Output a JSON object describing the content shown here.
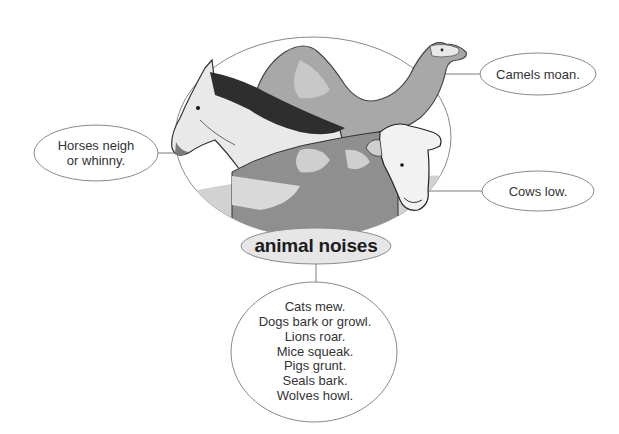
{
  "diagram": {
    "type": "mind-map",
    "center": {
      "label": "animal noises",
      "fill": "#e6e6e6"
    },
    "illustration": {
      "subjects": [
        "horse",
        "camel",
        "cow"
      ],
      "style": "grayscale drawing inside ellipse"
    },
    "satellites": [
      {
        "id": "horses",
        "lines": [
          "Horses neigh",
          "or whinny."
        ],
        "position": "left"
      },
      {
        "id": "camels",
        "lines": [
          "Camels moan."
        ],
        "position": "top-right"
      },
      {
        "id": "cows",
        "lines": [
          "Cows low."
        ],
        "position": "right"
      }
    ],
    "list_node": {
      "lines": [
        "Cats mew.",
        "Dogs bark or growl.",
        "Lions roar.",
        "Mice squeak.",
        "Pigs grunt.",
        "Seals bark.",
        "Wolves howl."
      ]
    },
    "colors": {
      "outline": "#8a8a8a",
      "connector": "#7a7a7a",
      "illustration_dark": "#555555",
      "illustration_mid": "#9a9a9a",
      "illustration_light": "#c8c8c8"
    }
  }
}
